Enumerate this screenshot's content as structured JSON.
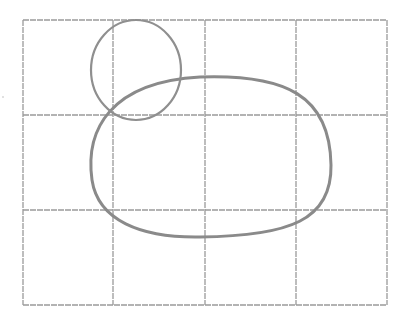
{
  "drawing": {
    "description": "Pencil sketch: 4x3 construction grid with a small circle overlapping a large rounded oval",
    "colors": {
      "grid": "#9a9a9a",
      "shape": "#8c8c8c",
      "background": "#ffffff"
    },
    "grid": {
      "columns": 4,
      "rows": 3,
      "x_lines": [
        23,
        113,
        205,
        296,
        387
      ],
      "y_lines": [
        20,
        115,
        210,
        305
      ]
    },
    "shapes": [
      {
        "name": "small-circle",
        "cx": 135,
        "cy": 70,
        "rx": 45,
        "ry": 50
      },
      {
        "name": "large-oval",
        "left": 90,
        "top": 77,
        "right": 331,
        "bottom": 237
      }
    ]
  }
}
